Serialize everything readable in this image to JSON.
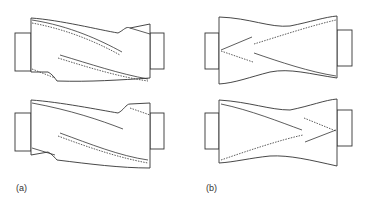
{
  "figure": {
    "panels": [
      {
        "id": "a",
        "label": "(a)",
        "description": "Two rotor/roller profiles with helical (twisted) grooves running diagonally in the same direction"
      },
      {
        "id": "b",
        "label": "(b)",
        "description": "Two roller profiles with converging V-shaped (chevron) grooves"
      }
    ]
  }
}
